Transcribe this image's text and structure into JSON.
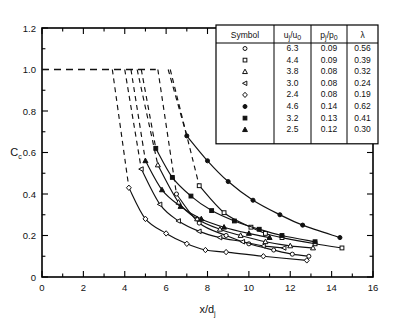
{
  "chart_data": {
    "type": "line",
    "title": "",
    "xlabel": "x/d_j",
    "ylabel": "C_c",
    "xlim": [
      0,
      16
    ],
    "ylim": [
      0,
      1.2
    ],
    "xticks": [
      0,
      2,
      4,
      6,
      8,
      10,
      12,
      14,
      16
    ],
    "xticklabels": [
      "0",
      "2",
      "4",
      "6",
      "8",
      "10",
      "12",
      "14",
      "16"
    ],
    "yticks": [
      0,
      0.2,
      0.4,
      0.6,
      0.8,
      1.0,
      1.2
    ],
    "yticklabels": [
      "0",
      "0.2",
      "0.4",
      "0.6",
      "0.8",
      "1.0",
      "1.2"
    ],
    "xminor_step": 1,
    "yminor_step": 0.1,
    "grid": false,
    "legend_position": "top-right-inset",
    "plateau": {
      "value": 1.0,
      "x_start": 0,
      "x_end": 5.5,
      "style": "dashed"
    },
    "series": [
      {
        "name": "uj/u0 = 6.3",
        "marker": "open-circle",
        "lambda": 0.56,
        "uj_u0": 6.3,
        "pj_p0": 0.09,
        "x": [
          5.6,
          6.5,
          7.6,
          8.9,
          10.0,
          11.2,
          12.1,
          12.9
        ],
        "y": [
          1.0,
          0.4,
          0.26,
          0.2,
          0.16,
          0.13,
          0.11,
          0.1
        ],
        "break_x": 5.6
      },
      {
        "name": "uj/u0 = 4.4",
        "marker": "open-square",
        "lambda": 0.39,
        "uj_u0": 4.4,
        "pj_p0": 0.09,
        "x": [
          6.2,
          7.6,
          8.8,
          10.1,
          10.8,
          11.6,
          13.2,
          14.5
        ],
        "y": [
          1.0,
          0.44,
          0.31,
          0.24,
          0.21,
          0.19,
          0.16,
          0.14
        ],
        "break_x": 6.2
      },
      {
        "name": "uj/u0 = 3.8",
        "marker": "open-triangle-up",
        "lambda": 0.32,
        "uj_u0": 3.8,
        "pj_p0": 0.08,
        "x": [
          4.6,
          5.6,
          6.6,
          7.5,
          8.6,
          9.6,
          10.8,
          12.0,
          13.1
        ],
        "y": [
          1.0,
          0.54,
          0.36,
          0.28,
          0.23,
          0.2,
          0.17,
          0.15,
          0.14
        ],
        "break_x": 4.6
      },
      {
        "name": "uj/u0 = 3.0",
        "marker": "open-triangle-left",
        "lambda": 0.24,
        "uj_u0": 3.0,
        "pj_p0": 0.08,
        "x": [
          4.0,
          4.8,
          5.7,
          6.6,
          7.6,
          8.6,
          9.7,
          10.7,
          11.7
        ],
        "y": [
          1.0,
          0.52,
          0.35,
          0.27,
          0.22,
          0.19,
          0.17,
          0.15,
          0.14
        ],
        "break_x": 4.0
      },
      {
        "name": "uj/u0 = 2.4",
        "marker": "open-diamond",
        "lambda": 0.19,
        "uj_u0": 2.4,
        "pj_p0": 0.08,
        "x": [
          3.4,
          4.2,
          5.0,
          6.0,
          7.0,
          7.9,
          8.9,
          10.7,
          12.8
        ],
        "y": [
          1.0,
          0.43,
          0.28,
          0.21,
          0.16,
          0.13,
          0.12,
          0.1,
          0.08
        ],
        "break_x": 3.4
      },
      {
        "name": "uj/u0 = 4.6",
        "marker": "filled-circle",
        "lambda": 0.62,
        "uj_u0": 4.6,
        "pj_p0": 0.14,
        "x": [
          6.1,
          7.0,
          8.0,
          9.0,
          10.2,
          11.5,
          12.6,
          14.4
        ],
        "y": [
          1.0,
          0.68,
          0.56,
          0.46,
          0.37,
          0.3,
          0.25,
          0.19
        ],
        "break_x": 6.1
      },
      {
        "name": "uj/u0 = 3.2",
        "marker": "filled-square",
        "lambda": 0.41,
        "uj_u0": 3.2,
        "pj_p0": 0.13,
        "x": [
          4.8,
          5.5,
          6.3,
          7.2,
          8.2,
          9.3,
          10.5,
          11.6,
          13.2
        ],
        "y": [
          1.0,
          0.62,
          0.48,
          0.39,
          0.32,
          0.27,
          0.23,
          0.2,
          0.17
        ],
        "break_x": 4.8
      },
      {
        "name": "uj/u0 = 2.5",
        "marker": "filled-triangle-up",
        "lambda": 0.3,
        "uj_u0": 2.5,
        "pj_p0": 0.12,
        "x": [
          4.3,
          5.0,
          5.8,
          6.7,
          7.7,
          8.8,
          10.0,
          11.0
        ],
        "y": [
          1.0,
          0.56,
          0.42,
          0.34,
          0.28,
          0.24,
          0.21,
          0.19
        ],
        "break_x": 4.3
      }
    ]
  },
  "legend_table": {
    "headers": [
      "Symbol",
      "u_j/u_0",
      "p_j/p_0",
      "λ"
    ],
    "header_parts": [
      {
        "main": "Symbol",
        "sub": ""
      },
      {
        "base1": "u",
        "sub1": "j",
        "slash": "/u",
        "sub2": "0"
      },
      {
        "base1": "p",
        "sub1": "j",
        "slash": "/p",
        "sub2": "0"
      },
      {
        "main": "λ",
        "sub": ""
      }
    ],
    "rows": [
      {
        "marker": "open-circle",
        "uj_u0": "6.3",
        "pj_p0": "0.09",
        "lambda": "0.56"
      },
      {
        "marker": "open-square",
        "uj_u0": "4.4",
        "pj_p0": "0.09",
        "lambda": "0.39"
      },
      {
        "marker": "open-triangle-up",
        "uj_u0": "3.8",
        "pj_p0": "0.08",
        "lambda": "0.32"
      },
      {
        "marker": "open-triangle-left",
        "uj_u0": "3.0",
        "pj_p0": "0.08",
        "lambda": "0.24"
      },
      {
        "marker": "open-diamond",
        "uj_u0": "2.4",
        "pj_p0": "0.08",
        "lambda": "0.19"
      },
      {
        "marker": "filled-circle",
        "uj_u0": "4.6",
        "pj_p0": "0.14",
        "lambda": "0.62"
      },
      {
        "marker": "filled-square",
        "uj_u0": "3.2",
        "pj_p0": "0.13",
        "lambda": "0.41"
      },
      {
        "marker": "filled-triangle-up",
        "uj_u0": "2.5",
        "pj_p0": "0.12",
        "lambda": "0.30"
      }
    ]
  },
  "axis_titles": {
    "y_base": "C",
    "y_sub": "c",
    "x_base": "x/d",
    "x_sub": "j"
  },
  "colors": {
    "line": "#1a1a1a",
    "axis": "#000000",
    "background": "#ffffff"
  }
}
